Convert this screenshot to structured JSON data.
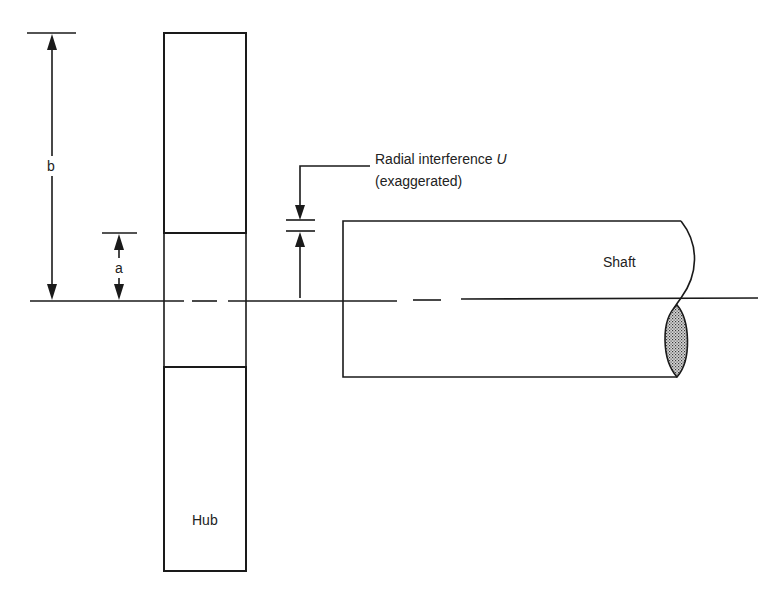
{
  "diagram": {
    "labels": {
      "outer_radius": "b",
      "inner_radius": "a",
      "interference_line1": "Radial interference ",
      "interference_symbol": "U",
      "interference_line2": "(exaggerated)",
      "shaft": "Shaft",
      "hub": "Hub"
    },
    "components": [
      {
        "id": "hub",
        "label": "Hub",
        "shading": "stippled"
      },
      {
        "id": "shaft",
        "label": "Shaft",
        "end_section": "stippled break"
      }
    ],
    "dimensions": [
      {
        "id": "b",
        "label": "b",
        "meaning": "outer radius of hub"
      },
      {
        "id": "a",
        "label": "a",
        "meaning": "inner (bore) radius of hub"
      },
      {
        "id": "U",
        "label": "Radial interference U (exaggerated)"
      }
    ],
    "colors": {
      "line": "#1a1a1a",
      "stipple_dark": "#3a3a3a",
      "stipple_light": "#d8d8d8",
      "background": "#ffffff"
    }
  }
}
